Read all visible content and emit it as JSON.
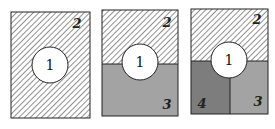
{
  "colors": {
    "background": "#ffffff",
    "stroke": "#222222",
    "hatch": "#555555",
    "region3": "#a3a3a3",
    "region4": "#7d7d7d",
    "circle": "#ffffff"
  },
  "panels": [
    {
      "name": "panel-1",
      "labels": {
        "circle": "1",
        "top": "2"
      }
    },
    {
      "name": "panel-2",
      "labels": {
        "circle": "1",
        "top": "2",
        "bottom": "3"
      }
    },
    {
      "name": "panel-3",
      "labels": {
        "circle": "1",
        "top": "2",
        "bottom_right": "3",
        "bottom_left": "4"
      }
    }
  ]
}
